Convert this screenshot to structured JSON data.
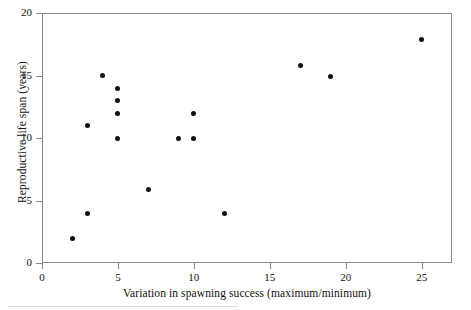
{
  "chart_data": {
    "type": "scatter",
    "title": "",
    "xlabel": "Variation in spawning success (maximum/minimum)",
    "ylabel": "Reproductive life span (years)",
    "xlim": [
      0,
      27
    ],
    "ylim": [
      0,
      20
    ],
    "xticks": [
      0,
      5,
      10,
      15,
      20,
      25
    ],
    "yticks": [
      0,
      5,
      10,
      15,
      20
    ],
    "xtick_labels": [
      "0",
      "5",
      "10",
      "15",
      "20",
      "25"
    ],
    "ytick_labels": [
      "0",
      "5",
      "10",
      "15",
      "20"
    ],
    "grid": false,
    "legend": null,
    "marker": {
      "shape": "circle",
      "color": "#111111",
      "size_px": 5
    },
    "axis_color": "#8a8a8a",
    "points": [
      {
        "x": 2,
        "y": 2
      },
      {
        "x": 3,
        "y": 4
      },
      {
        "x": 3,
        "y": 11
      },
      {
        "x": 4,
        "y": 15
      },
      {
        "x": 5,
        "y": 14
      },
      {
        "x": 5,
        "y": 13
      },
      {
        "x": 5,
        "y": 12
      },
      {
        "x": 5,
        "y": 10
      },
      {
        "x": 7,
        "y": 5.9
      },
      {
        "x": 9,
        "y": 10
      },
      {
        "x": 10,
        "y": 10
      },
      {
        "x": 10,
        "y": 12
      },
      {
        "x": 12,
        "y": 4
      },
      {
        "x": 17,
        "y": 15.8
      },
      {
        "x": 19,
        "y": 14.9
      },
      {
        "x": 25,
        "y": 17.9
      }
    ]
  }
}
